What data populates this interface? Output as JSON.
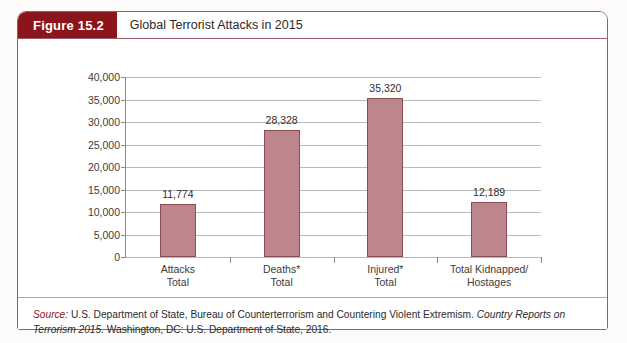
{
  "figure": {
    "badge": "Figure 15.2",
    "title": "Global Terrorist Attacks in 2015"
  },
  "source": {
    "label": "Source:",
    "text_before_italic": " U.S. Department of State, Bureau of Counterterrorism and Countering Violent Extremism. ",
    "italic_title": "Country Reports on Terrorism 2015.",
    "text_after_italic": " Washington, DC: U.S. Department of State, 2016."
  },
  "colors": {
    "badge_background": "#8c151b",
    "bar_fill": "#bd868d",
    "bar_border": "#8c4a52",
    "card_border": "#9b5c63",
    "gridline": "#b9b9b9",
    "source_label": "#8c151b"
  },
  "chart_data": {
    "type": "bar",
    "title": "Global Terrorist Attacks in 2015",
    "xlabel": "",
    "ylabel": "",
    "ylim": [
      0,
      40000
    ],
    "ytick_interval": 5000,
    "yticks": [
      0,
      5000,
      10000,
      15000,
      20000,
      25000,
      30000,
      35000,
      40000
    ],
    "ytick_labels": [
      "0",
      "5,000",
      "10,000",
      "15,000",
      "20,000",
      "25,000",
      "30,000",
      "35,000",
      "40,000"
    ],
    "grid": true,
    "legend": false,
    "categories": [
      "Attacks Total",
      "Deaths* Total",
      "Injured* Total",
      "Total Kidnapped/ Hostages"
    ],
    "category_lines": [
      [
        "Attacks",
        "Total"
      ],
      [
        "Deaths*",
        "Total"
      ],
      [
        "Injured*",
        "Total"
      ],
      [
        "Total Kidnapped/",
        "Hostages"
      ]
    ],
    "values": [
      11774,
      28328,
      35320,
      12189
    ],
    "value_labels": [
      "11,774",
      "28,328",
      "35,320",
      "12,189"
    ]
  }
}
